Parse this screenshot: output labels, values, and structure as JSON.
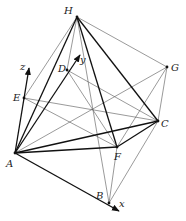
{
  "diagram": {
    "type": "cube-with-inscribed-tetrahedron",
    "vertices": {
      "A": [
        15,
        153
      ],
      "B": [
        109,
        203
      ],
      "C": [
        158,
        121
      ],
      "D": [
        67,
        70
      ],
      "E": [
        24,
        98
      ],
      "F": [
        117,
        147
      ],
      "G": [
        167,
        67
      ],
      "H": [
        77,
        17
      ]
    },
    "labels": {
      "A": "A",
      "B": "B",
      "C": "C",
      "D": "D",
      "E": "E",
      "F": "F",
      "G": "G",
      "H": "H",
      "x": "x",
      "y": "y",
      "z": "z"
    },
    "axes": {
      "x": {
        "from": "A",
        "to": [
          119,
          211
        ]
      },
      "y": {
        "from": "A",
        "to": [
          80,
          55
        ]
      },
      "z": {
        "from": "A",
        "to": [
          29,
          68
        ]
      }
    },
    "thick_edges": [
      [
        "A",
        "C"
      ],
      [
        "A",
        "F"
      ],
      [
        "A",
        "H"
      ],
      [
        "C",
        "F"
      ],
      [
        "C",
        "H"
      ],
      [
        "F",
        "H"
      ]
    ],
    "thin_edges": [
      [
        "B",
        "F"
      ],
      [
        "B",
        "C"
      ],
      [
        "B",
        "H"
      ],
      [
        "E",
        "F"
      ],
      [
        "E",
        "C"
      ],
      [
        "E",
        "H"
      ],
      [
        "D",
        "H"
      ],
      [
        "D",
        "C"
      ],
      [
        "D",
        "F"
      ],
      [
        "G",
        "H"
      ],
      [
        "G",
        "C"
      ],
      [
        "G",
        "F"
      ],
      [
        "G",
        "A"
      ]
    ]
  }
}
